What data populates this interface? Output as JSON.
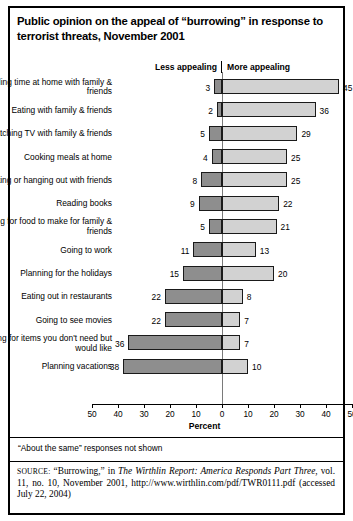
{
  "title": "Public opinion on the appeal of “burrowing” in response to terrorist threats, November 2001",
  "header": {
    "less": "Less appealing",
    "more": "More appealing"
  },
  "footnote": "“About the same” responses not shown",
  "source": {
    "label": "SOURCE:",
    "text_1": " “Burrowing,” in ",
    "italic_1": "The Wirthlin Report: America Responds Part Three",
    "text_2": ", vol. 11, no. 10, November 2001, http://www.wirthlin.com/pdf/TWR0111.pdf (accessed July 22, 2004)"
  },
  "colors": {
    "less_appealing": "#8e8e8e",
    "more_appealing": "#d2d2d2",
    "border": "#1a1a1a",
    "axis": "#000000"
  },
  "chart_data": {
    "type": "bar",
    "orientation": "horizontal",
    "layout": "diverging",
    "title": "Public opinion on the appeal of “burrowing” in response to terrorist threats, November 2001",
    "xlabel": "Percent",
    "ylabel": "",
    "xlim": [
      -50,
      50
    ],
    "xticks": [
      -50,
      -40,
      -30,
      -20,
      -10,
      0,
      10,
      20,
      30,
      40,
      50
    ],
    "xticklabels": [
      "50",
      "40",
      "30",
      "20",
      "10",
      "0",
      "10",
      "20",
      "30",
      "40",
      "50"
    ],
    "grid": false,
    "legend_position": "top",
    "categories": [
      "Spending time at home with family & friends",
      "Eating with family & friends",
      "Watching TV with family & friends",
      "Cooking meals at home",
      "Visiting or hanging out with friends",
      "Reading books",
      "Shopping for food to make for family & friends",
      "Going to work",
      "Planning for the holidays",
      "Eating out in restaurants",
      "Going to see movies",
      "Shopping for items you don't need but would like",
      "Planning vacations"
    ],
    "series": [
      {
        "name": "Less appealing",
        "direction": "left",
        "color": "#8e8e8e",
        "values": [
          3,
          2,
          5,
          4,
          8,
          9,
          5,
          11,
          15,
          22,
          22,
          36,
          38
        ]
      },
      {
        "name": "More appealing",
        "direction": "right",
        "color": "#d2d2d2",
        "values": [
          45,
          36,
          29,
          25,
          25,
          22,
          21,
          13,
          20,
          8,
          7,
          7,
          10
        ]
      }
    ]
  }
}
